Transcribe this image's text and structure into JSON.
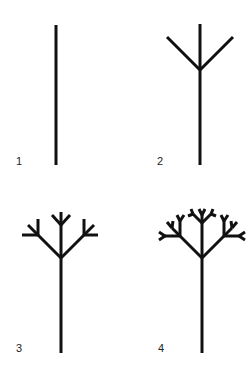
{
  "stage_color": "#111111",
  "stages": [
    {
      "label": "1",
      "description": "single vertical stem"
    },
    {
      "label": "2",
      "description": "stem with three-way branch"
    },
    {
      "label": "3",
      "description": "second-order branching"
    },
    {
      "label": "4",
      "description": "third-order dense branching"
    }
  ]
}
